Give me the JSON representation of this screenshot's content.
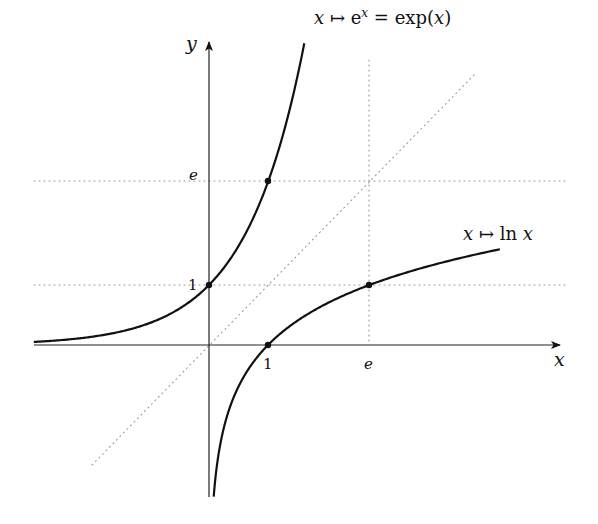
{
  "diagram": {
    "axes": {
      "x_label": "x",
      "y_label": "y",
      "origin_px": [
        209,
        345
      ],
      "unit_px": [
        59,
        60
      ]
    },
    "ticks": {
      "x": [
        {
          "value": 1,
          "label": "1"
        },
        {
          "value": 2.718,
          "label": "e"
        }
      ],
      "y": [
        {
          "value": 1,
          "label": "1"
        },
        {
          "value": 2.718,
          "label": "e"
        }
      ]
    },
    "curves": [
      {
        "name": "exp",
        "label_parts": [
          "x ↦ e",
          "x",
          " = exp(x)"
        ],
        "x_range": [
          -2.97,
          1.615
        ],
        "points": [
          [
            0,
            1
          ],
          [
            1,
            2.718
          ]
        ]
      },
      {
        "name": "ln",
        "label": "x ↦ ln x",
        "x_range": [
          0.08,
          4.93
        ],
        "points": [
          [
            1,
            0
          ],
          [
            2.718,
            1
          ]
        ]
      }
    ],
    "guides": {
      "diagonal_label": "y = x (dotted)",
      "dotted_lines": [
        "y = 1",
        "y = e",
        "x = e",
        "y = x"
      ]
    },
    "colors": {
      "curve": "#111111",
      "axis": "#222222",
      "dotted": "#999999"
    }
  }
}
